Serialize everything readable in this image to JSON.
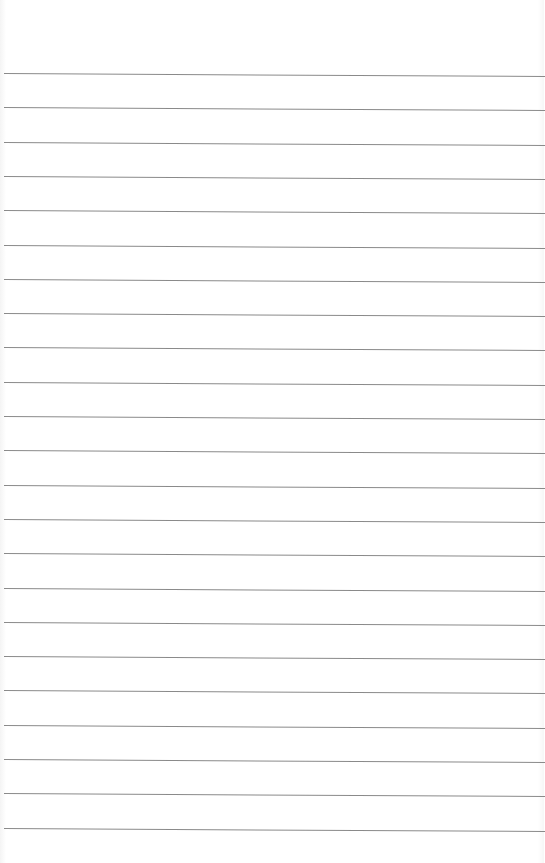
{
  "paper": {
    "type": "lined-paper",
    "background_color": "#ffffff",
    "line_color": "#8a8a8a",
    "line_count": 23,
    "first_line_y": 73,
    "line_spacing": 34.3
  }
}
